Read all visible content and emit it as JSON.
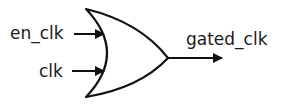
{
  "diagram": {
    "type": "logic-gate",
    "gate": "OR",
    "inputs": [
      {
        "label": "en_clk"
      },
      {
        "label": "clk"
      }
    ],
    "output": {
      "label": "gated_clk"
    },
    "colors": {
      "stroke": "#111111",
      "text": "#1a1a1a",
      "background": "#ffffff"
    }
  }
}
